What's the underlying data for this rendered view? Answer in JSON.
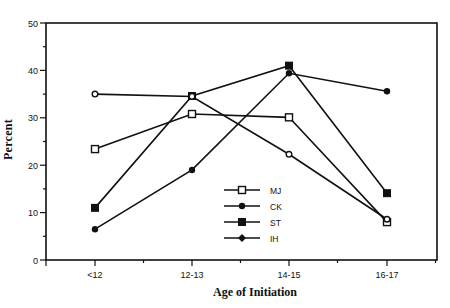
{
  "chart_data": {
    "type": "line",
    "title": "",
    "xlabel": "Age of Initiation",
    "ylabel": "Percent",
    "categories": [
      "<12",
      "12-13",
      "14-15",
      "16-17"
    ],
    "ylim": [
      0,
      50
    ],
    "yticks": [
      0,
      10,
      20,
      30,
      40,
      50
    ],
    "grid": false,
    "legend_position": "inside-lower-center",
    "series": [
      {
        "name": "MJ",
        "marker": "open-square",
        "values": [
          23.4,
          30.8,
          30.1,
          8.0
        ]
      },
      {
        "name": "CK",
        "marker": "filled-dot",
        "values": [
          6.5,
          19.0,
          39.4,
          35.6
        ]
      },
      {
        "name": "ST",
        "marker": "filled-square",
        "values": [
          11.0,
          34.6,
          41.0,
          14.1
        ]
      },
      {
        "name": "IH",
        "marker": "open-circle",
        "values": [
          35.0,
          34.5,
          22.3,
          8.6
        ]
      }
    ]
  },
  "labels": {
    "xlabel": "Age of Initiation",
    "ylabel": "Percent"
  }
}
